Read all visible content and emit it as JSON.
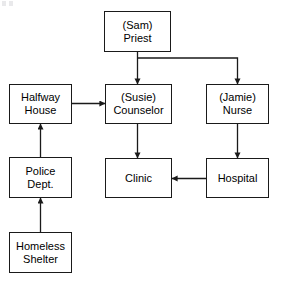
{
  "diagram": {
    "type": "flowchart",
    "background_color": "#ffffff",
    "line_color": "#1a1a1a",
    "text_color": "#000000",
    "nodes": [
      {
        "id": "priest",
        "name": "priest",
        "line1": "(Sam)",
        "line2": "Priest",
        "x": 104,
        "y": 11,
        "w": 67,
        "h": 41
      },
      {
        "id": "halfway_house",
        "name": "halfway-house",
        "line1": "Halfway",
        "line2": "House",
        "x": 9,
        "y": 84,
        "w": 63,
        "h": 40
      },
      {
        "id": "counselor",
        "name": "counselor",
        "line1": "(Susie)",
        "line2": "Counselor",
        "x": 105,
        "y": 84,
        "w": 67,
        "h": 40
      },
      {
        "id": "nurse",
        "name": "nurse",
        "line1": "(Jamie)",
        "line2": "Nurse",
        "x": 206,
        "y": 84,
        "w": 63,
        "h": 40
      },
      {
        "id": "police_dept",
        "name": "police-dept",
        "line1": "Police",
        "line2": "Dept.",
        "x": 9,
        "y": 157,
        "w": 63,
        "h": 41
      },
      {
        "id": "clinic",
        "name": "clinic",
        "line1": "Clinic",
        "line2": "",
        "x": 105,
        "y": 158,
        "w": 67,
        "h": 40
      },
      {
        "id": "hospital",
        "name": "hospital",
        "line1": "Hospital",
        "line2": "",
        "x": 206,
        "y": 158,
        "w": 63,
        "h": 40
      },
      {
        "id": "homeless_shelter",
        "name": "homeless-shelter",
        "line1": "Homeless",
        "line2": "Shelter",
        "x": 9,
        "y": 232,
        "w": 63,
        "h": 41
      }
    ],
    "edges": [
      {
        "id": "priest_to_counselor",
        "name": "edge-priest-to-counselor",
        "from": "priest",
        "to": "counselor",
        "path": "M 137.5 52 L 137.5 84",
        "arrow_at": "counselor",
        "direction": "down"
      },
      {
        "id": "priest_to_nurse",
        "name": "edge-priest-to-nurse",
        "from": "priest",
        "to": "nurse",
        "path": "M 137.5 58 L 237.5 58 L 237.5 84",
        "arrow_at": "nurse",
        "direction": "down"
      },
      {
        "id": "halfway_to_counselor",
        "name": "edge-halfway-house-to-counselor",
        "from": "halfway_house",
        "to": "counselor",
        "path": "M 72 103.5 L 105 103.5",
        "arrow_at": "counselor",
        "direction": "right"
      },
      {
        "id": "police_to_halfway",
        "name": "edge-police-dept-to-halfway-house",
        "from": "police_dept",
        "to": "halfway_house",
        "path": "M 40.5 157 L 40.5 124",
        "arrow_at": "halfway_house",
        "direction": "up"
      },
      {
        "id": "shelter_to_police",
        "name": "edge-homeless-shelter-to-police-dept",
        "from": "homeless_shelter",
        "to": "police_dept",
        "path": "M 40.5 232 L 40.5 198",
        "arrow_at": "police_dept",
        "direction": "up"
      },
      {
        "id": "counselor_to_clinic",
        "name": "edge-counselor-to-clinic",
        "from": "counselor",
        "to": "clinic",
        "path": "M 137.5 124 L 137.5 158",
        "arrow_at": "clinic",
        "direction": "down"
      },
      {
        "id": "nurse_to_hospital",
        "name": "edge-nurse-to-hospital",
        "from": "nurse",
        "to": "hospital",
        "path": "M 237.5 124 L 237.5 158",
        "arrow_at": "hospital",
        "direction": "down"
      },
      {
        "id": "hospital_to_clinic",
        "name": "edge-hospital-to-clinic",
        "from": "hospital",
        "to": "clinic",
        "path": "M 206 178.5 L 172 178.5",
        "arrow_at": "clinic",
        "direction": "left"
      }
    ]
  }
}
